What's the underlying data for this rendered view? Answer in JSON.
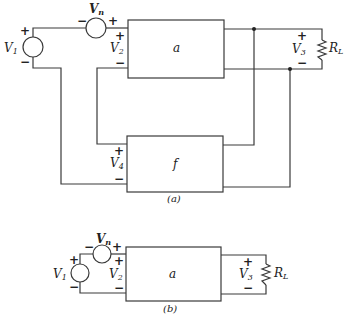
{
  "figure_a": {
    "caption": "(a)",
    "sources": {
      "v1": {
        "label": "V",
        "sub": "1",
        "plus": "+",
        "minus": "−"
      },
      "vn": {
        "label": "V",
        "sub": "n",
        "plus": "+",
        "minus": "−"
      }
    },
    "ports": {
      "v2": {
        "label": "V",
        "sub": "2",
        "plus": "+",
        "minus": "−"
      },
      "v3": {
        "label": "V",
        "sub": "3",
        "plus": "+",
        "minus": "−"
      },
      "v4": {
        "label": "V",
        "sub": "4",
        "plus": "+",
        "minus": "−"
      }
    },
    "blocks": {
      "amplifier": "a",
      "feedback": "f"
    },
    "load": {
      "label": "R",
      "sub": "L"
    }
  },
  "figure_b": {
    "caption": "(b)",
    "sources": {
      "v1": {
        "label": "V",
        "sub": "1",
        "plus": "+",
        "minus": "−"
      },
      "vn": {
        "label": "V",
        "sub": "n",
        "plus": "+",
        "minus": "−"
      }
    },
    "ports": {
      "v2": {
        "label": "V",
        "sub": "2",
        "plus": "+",
        "minus": "−"
      },
      "v3": {
        "label": "V",
        "sub": "3",
        "plus": "+",
        "minus": "−"
      }
    },
    "blocks": {
      "amplifier": "a"
    },
    "load": {
      "label": "R",
      "sub": "L"
    }
  }
}
